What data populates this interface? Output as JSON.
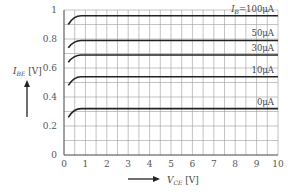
{
  "chart_data": {
    "type": "line",
    "title": "",
    "xlabel": "V_CE [V]",
    "ylabel": "I_BE [V]",
    "xlim": [
      0,
      10
    ],
    "ylim": [
      0,
      1
    ],
    "x_ticks": [
      "0",
      "1",
      "2",
      "3",
      "4",
      "5",
      "6",
      "7",
      "8",
      "9",
      "10"
    ],
    "y_ticks": [
      "0",
      "0.2",
      "0.4",
      "0.6",
      "0.8",
      "1"
    ],
    "grid": true,
    "legend_position": "inline-right",
    "series": [
      {
        "name": "I_B=100μA",
        "label": "I_B=100μA",
        "start": [
          0.2,
          0.9
        ],
        "knee_x": 0.8,
        "level": 0.96
      },
      {
        "name": "50μA",
        "label": "50μA",
        "start": [
          0.2,
          0.74
        ],
        "knee_x": 0.8,
        "level": 0.79
      },
      {
        "name": "30μA",
        "label": "30μA",
        "start": [
          0.2,
          0.64
        ],
        "knee_x": 0.8,
        "level": 0.69
      },
      {
        "name": "10μA",
        "label": "10μA",
        "start": [
          0.2,
          0.48
        ],
        "knee_x": 0.8,
        "level": 0.54
      },
      {
        "name": "0μA",
        "label": "0μA",
        "start": [
          0.2,
          0.26
        ],
        "knee_x": 0.8,
        "level": 0.32
      }
    ]
  },
  "labels": {
    "y_axis_main": "I",
    "y_axis_sub": "BE",
    "y_axis_unit": " [V]",
    "x_axis_main": "V",
    "x_axis_sub": "CE",
    "x_axis_unit": " [V]",
    "series_first_prefix_main": "I",
    "series_first_prefix_sub": "B",
    "series_first_suffix": "=100μA"
  }
}
